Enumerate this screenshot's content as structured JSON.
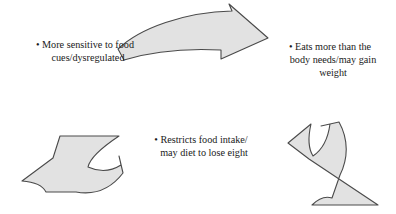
{
  "diagram": {
    "type": "cycle",
    "background_color": "#ffffff",
    "shape_fill": "#e2e2e2",
    "shape_stroke": "#4a4a4a",
    "text_color": "#1a1a1a",
    "bullet": "•",
    "labels": [
      {
        "id": "more-sensitive",
        "text": "• More sensitive to food\ncues/dysregulated",
        "position": "top-left"
      },
      {
        "id": "eats-more",
        "text": "• Eats more than the\nbody needs/may gain\nweight",
        "position": "top-right"
      },
      {
        "id": "restricts-intake",
        "text": "• Restricts food intake/\nmay diet to lose eight",
        "position": "center-bottom"
      }
    ],
    "arrows": [
      {
        "id": "arrow-top",
        "direction": "right",
        "description": "curved arrow pointing right, top center"
      },
      {
        "id": "arrow-bottom-left",
        "direction": "left",
        "description": "curved arrow pointing left, bottom left"
      },
      {
        "id": "arrow-bottom-right",
        "direction": "down-left",
        "description": "curved arrow pointing down-left, bottom right"
      }
    ]
  }
}
